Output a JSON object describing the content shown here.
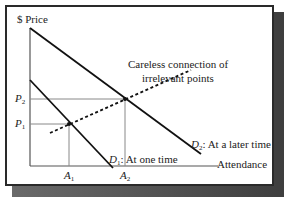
{
  "diagram": {
    "y_axis_label": "$ Price",
    "x_axis_label": "Attendance",
    "annotation_line1": "Careless connection of",
    "annotation_line2": "irrelevant points",
    "price_labels": [
      {
        "var": "P",
        "sub": "2"
      },
      {
        "var": "P",
        "sub": "1"
      }
    ],
    "quantity_labels": [
      {
        "var": "A",
        "sub": "1"
      },
      {
        "var": "A",
        "sub": "2"
      }
    ],
    "curves": [
      {
        "var": "D",
        "sub": "1",
        "desc": ": At one time"
      },
      {
        "var": "D",
        "sub": "2",
        "desc": ": At a later time"
      }
    ],
    "colors": {
      "axis": "#555555",
      "curve": "#111111",
      "guide": "#888888",
      "frame": "#2a2a2a",
      "shadow": "#4a4a4a"
    }
  }
}
